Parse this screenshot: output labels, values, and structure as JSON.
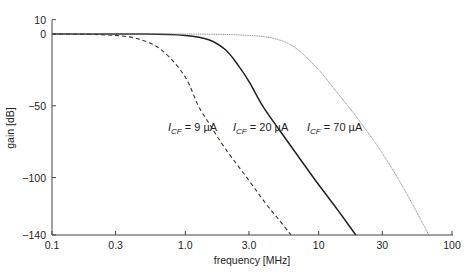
{
  "chart_data": {
    "type": "line",
    "title": "",
    "xlabel": "frequency [MHz]",
    "ylabel": "gain [dB]",
    "xscale": "log",
    "xlim": [
      0.1,
      100
    ],
    "ylim": [
      -140,
      10
    ],
    "x_ticks": [
      "0.1",
      "0.3",
      "1.0",
      "3.0",
      "10",
      "30",
      "100"
    ],
    "x_tick_values": [
      0.1,
      0.3,
      1.0,
      3.0,
      10,
      30,
      100
    ],
    "y_ticks": [
      "10",
      "0",
      "-50",
      "-100",
      "-140"
    ],
    "y_tick_values": [
      10,
      0,
      -50,
      -100,
      -140
    ],
    "grid": false,
    "legend": "none (inline annotations)",
    "series": [
      {
        "name": "I_CF = 9 µA",
        "style": "dashed",
        "color": "#333333",
        "x": [
          0.1,
          0.3,
          0.5,
          0.7,
          1.0,
          1.25,
          1.5,
          2.0,
          3.0,
          4.0,
          5.0,
          6.2
        ],
        "y": [
          0,
          -1,
          -5,
          -13,
          -30,
          -50,
          -62,
          -80,
          -102,
          -118,
          -129,
          -140
        ]
      },
      {
        "name": "I_CF = 20 µA",
        "style": "solid",
        "color": "#222222",
        "x": [
          0.1,
          0.5,
          1.0,
          1.5,
          2.0,
          2.5,
          3.0,
          3.8,
          5.0,
          7.0,
          10,
          14,
          19
        ],
        "y": [
          0,
          0,
          -1,
          -4,
          -11,
          -22,
          -33,
          -50,
          -66,
          -85,
          -105,
          -123,
          -140
        ]
      },
      {
        "name": "I_CF = 70 µA",
        "style": "dotted-thin",
        "color": "#777777",
        "x": [
          0.1,
          1.0,
          3.0,
          5.0,
          7.0,
          10,
          13,
          16.5,
          20,
          30,
          45,
          67
        ],
        "y": [
          0,
          0,
          -1,
          -4,
          -11,
          -25,
          -38,
          -50,
          -60,
          -83,
          -110,
          -140
        ]
      }
    ],
    "annotations": [
      {
        "text_main": "I",
        "sub": "CF",
        "rest": " = 9 µA"
      },
      {
        "text_main": "I",
        "sub": "CF",
        "rest": " = 20 µA"
      },
      {
        "text_main": "I",
        "sub": "CF",
        "rest": " = 70 µA"
      }
    ]
  }
}
